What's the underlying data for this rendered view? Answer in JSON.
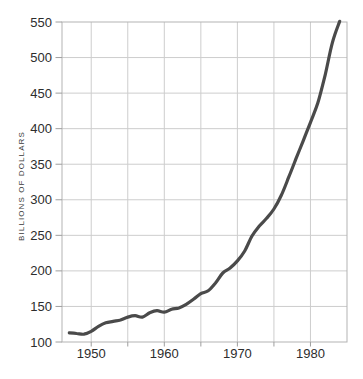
{
  "chart_data": {
    "type": "line",
    "title": "",
    "xlabel": "",
    "ylabel": "BILLIONS OF DOLLARS",
    "x": [
      1947,
      1948,
      1949,
      1950,
      1951,
      1952,
      1953,
      1954,
      1955,
      1956,
      1957,
      1958,
      1959,
      1960,
      1961,
      1962,
      1963,
      1964,
      1965,
      1966,
      1967,
      1968,
      1969,
      1970,
      1971,
      1972,
      1973,
      1974,
      1975,
      1976,
      1977,
      1978,
      1979,
      1980,
      1981,
      1982,
      1983,
      1984
    ],
    "series": [
      {
        "name": "money-stock-billions",
        "values": [
          113,
          112,
          111,
          115,
          122,
          127,
          129,
          131,
          135,
          137,
          135,
          141,
          144,
          142,
          146,
          148,
          153,
          160,
          168,
          172,
          183,
          197,
          204,
          214,
          228,
          249,
          263,
          274,
          287,
          306,
          331,
          357,
          383,
          409,
          436,
          475,
          521,
          551
        ]
      }
    ],
    "xlim": [
      1946,
      1985
    ],
    "ylim": [
      100,
      550
    ],
    "x_grid_ticks": [
      1950,
      1955,
      1960,
      1965,
      1970,
      1975,
      1980
    ],
    "x_tick_labels": [
      "1950",
      "1960",
      "1970",
      "1980"
    ],
    "y_ticks": [
      100,
      150,
      200,
      250,
      300,
      350,
      400,
      450,
      500,
      550
    ],
    "grid": true,
    "legend": "none",
    "colors": {
      "line": "#4a4a4a",
      "grid": "#cdcdcd",
      "axis_frame": "#b3b3b3",
      "tick_mark": "#9e9e9e",
      "tick_label": "#2d2d2d",
      "background": "#ffffff"
    }
  }
}
